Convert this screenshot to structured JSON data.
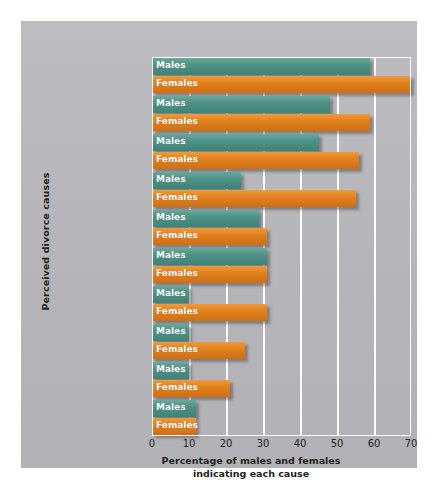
{
  "chart_data": {
    "type": "bar",
    "orientation": "horizontal",
    "title": "",
    "xlabel": "Percentage of males and females indicating each cause",
    "ylabel": "Perceived divorce causes",
    "xlim": [
      0,
      70
    ],
    "xticks": [
      0,
      10,
      20,
      30,
      40,
      50,
      60,
      70
    ],
    "grid": true,
    "legend_position": "in-bar",
    "categories": [
      "Communication\nproblems",
      "Basic\nunhappiness",
      "Incompatibility",
      "Emotional\nabuse",
      "Financial\nproblems",
      "Sexual\nproblems",
      "Alcohol abuse\nby spouse",
      "Infidelity\nby spouse",
      "Physical\nabuse",
      "In-laws"
    ],
    "series": [
      {
        "name": "Males",
        "color": "#4e9287",
        "values": [
          59,
          48,
          45,
          24,
          29,
          31,
          10,
          10,
          10,
          12
        ]
      },
      {
        "name": "Females",
        "color": "#e2811e",
        "values": [
          70,
          59,
          56,
          55,
          31,
          31,
          31,
          25,
          21,
          12
        ]
      }
    ]
  },
  "axis": {
    "y_title": "Perceived divorce causes",
    "x_title_line1": "Percentage of males and females",
    "x_title_line2": "indicating each cause",
    "x_tick_labels": [
      "0",
      "10",
      "20",
      "30",
      "40",
      "50",
      "60",
      "70"
    ]
  },
  "colors": {
    "background": "#ffffff",
    "card": "#b8b8bc",
    "males": "#4e9287",
    "females": "#e2811e",
    "gridline": "#ffffff",
    "text": "#231f20",
    "bar_label_text": "#ffffff"
  }
}
